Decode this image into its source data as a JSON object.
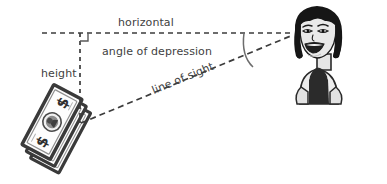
{
  "figure": {
    "background_color": "#ffffff",
    "ink_color": "#414141",
    "labels": {
      "horizontal": "horizontal",
      "angle_of_depression": "angle of depression",
      "height": "height",
      "line_of_sight": "line of sight"
    },
    "elements": {
      "observer": "cartoon-woman-smiling",
      "target": "stack-of-dollar-bills",
      "right_angle_marker": "right-angle-square",
      "angle_arc": "angle-of-depression-arc"
    },
    "geometry": {
      "horizontal_line": {
        "x1": 42,
        "y1": 33,
        "x2": 292,
        "y2": 33,
        "style": "dashed"
      },
      "vertical_line": {
        "x1": 80,
        "y1": 33,
        "x2": 80,
        "y2": 122,
        "style": "dashed"
      },
      "line_of_sight": {
        "x1": 82,
        "y1": 122,
        "x2": 292,
        "y2": 35,
        "style": "dashed"
      },
      "right_angle_marker": {
        "x": 80,
        "y": 33,
        "size": 7
      },
      "angle_arc": {
        "cx": 292,
        "cy": 34,
        "radius": 48
      }
    }
  }
}
